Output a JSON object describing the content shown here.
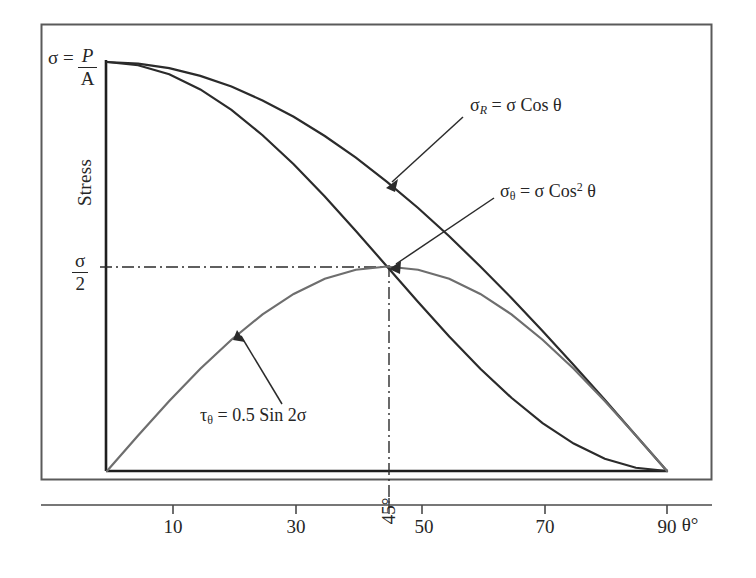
{
  "chart_data": {
    "type": "line",
    "title": "",
    "xlabel": "θ°",
    "ylabel": "Stress",
    "xlim": [
      0,
      96
    ],
    "ylim": [
      0,
      1.0
    ],
    "grid": false,
    "legend_position": "inline-annotations",
    "x_ticks": [
      {
        "value": 10,
        "label": "10",
        "rotated": false
      },
      {
        "value": 30,
        "label": "30",
        "rotated": false
      },
      {
        "value": 45,
        "label": "45°",
        "rotated": true
      },
      {
        "value": 50,
        "label": "50",
        "rotated": false
      },
      {
        "value": 70,
        "label": "70",
        "rotated": false
      },
      {
        "value": 90,
        "label": "90",
        "rotated": false
      }
    ],
    "y_ticks": [
      {
        "value": 1.0,
        "label": "σ = P/A"
      },
      {
        "value": 0.5,
        "label": "σ/2"
      }
    ],
    "series": [
      {
        "name": "sigma_R",
        "label": "σ_R = σ Cos θ",
        "formula": "sigma * cos(theta)",
        "color": "#2b2b2b",
        "x": [
          0,
          5,
          10,
          15,
          20,
          25,
          30,
          35,
          40,
          45,
          50,
          55,
          60,
          65,
          70,
          75,
          80,
          85,
          90
        ],
        "values": [
          1.0,
          0.996,
          0.985,
          0.966,
          0.94,
          0.906,
          0.866,
          0.819,
          0.766,
          0.707,
          0.643,
          0.574,
          0.5,
          0.423,
          0.342,
          0.259,
          0.174,
          0.087,
          0.0
        ]
      },
      {
        "name": "sigma_theta",
        "label": "σ_θ = σ Cos² θ",
        "formula": "sigma * cos(theta)^2",
        "color": "#2b2b2b",
        "x": [
          0,
          5,
          10,
          15,
          20,
          25,
          30,
          35,
          40,
          45,
          50,
          55,
          60,
          65,
          70,
          75,
          80,
          85,
          90
        ],
        "values": [
          1.0,
          0.992,
          0.97,
          0.933,
          0.883,
          0.821,
          0.75,
          0.671,
          0.587,
          0.5,
          0.413,
          0.329,
          0.25,
          0.179,
          0.117,
          0.067,
          0.03,
          0.008,
          0.0
        ]
      },
      {
        "name": "tau_theta",
        "label": "τ_θ = 0.5 Sin 2σ",
        "formula": "0.5 * sin(2*theta)",
        "color": "#6e6e6e",
        "x": [
          0,
          5,
          10,
          15,
          20,
          25,
          30,
          35,
          40,
          45,
          50,
          55,
          60,
          65,
          70,
          75,
          80,
          85,
          90
        ],
        "values": [
          0.0,
          0.087,
          0.171,
          0.25,
          0.321,
          0.383,
          0.433,
          0.47,
          0.492,
          0.5,
          0.492,
          0.47,
          0.433,
          0.383,
          0.321,
          0.25,
          0.171,
          0.087,
          0.0
        ]
      }
    ],
    "guide_lines": [
      {
        "name": "sigma-half-horizontal",
        "orientation": "horizontal",
        "value": 0.5,
        "style": "dash-dot"
      },
      {
        "name": "forty-five-vertical",
        "orientation": "vertical",
        "value": 45,
        "style": "dash-dot"
      }
    ],
    "annotations": [
      {
        "name": "sigma-R",
        "text": "σ_R = σ Cos θ",
        "points_to": [
          30,
          0.866
        ]
      },
      {
        "name": "sigma-theta",
        "text": "σ_θ = σ Cos² θ",
        "points_to": [
          45,
          0.5
        ]
      },
      {
        "name": "tau-theta",
        "text": "τ_θ = 0.5 Sin 2σ",
        "points_to": [
          22,
          0.345
        ]
      }
    ]
  },
  "labels": {
    "y_axis_top": {
      "sigma": "σ",
      "equals": "=",
      "numerator": "P",
      "denominator": "A"
    },
    "y_axis_half": {
      "numerator": "σ",
      "denominator": "2"
    },
    "y_axis_title": "Stress",
    "x_axis_title": "θ°",
    "ticks": {
      "t10": "10",
      "t30": "30",
      "t45": "45°",
      "t50": "50",
      "t70": "70",
      "t90": "90"
    },
    "annotation_sigma_r": {
      "sym": "σ",
      "sub": "R",
      "rest": "= σ Cos θ"
    },
    "annotation_sigma_theta": {
      "sym": "σ",
      "sub": "θ",
      "mid": "= σ Cos",
      "sup": "2",
      "rest": "θ"
    },
    "annotation_tau_theta": {
      "sym": "τ",
      "sub": "θ",
      "rest": "= 0.5 Sin 2σ"
    }
  },
  "colors": {
    "curve_dark": "#2b2b2b",
    "curve_light": "#6e6e6e",
    "axis": "#1f1f1f",
    "frame": "#5a5a5a",
    "background": "#ffffff"
  }
}
